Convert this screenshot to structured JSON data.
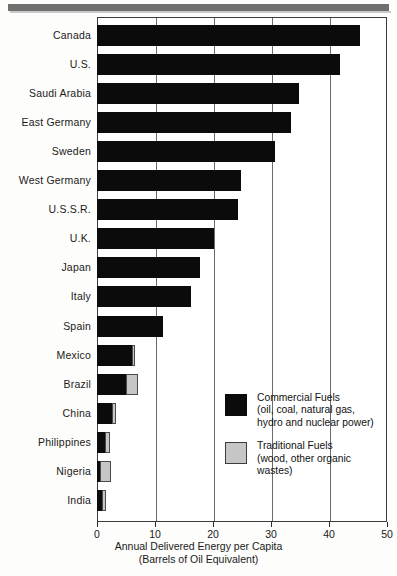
{
  "chart_data": {
    "type": "bar",
    "orientation": "horizontal",
    "stacked": true,
    "title": "",
    "xlabel": "Annual Delivered Energy per Capita",
    "xlabel_line2": "(Barrels of Oil Equivalent)",
    "ylabel": "",
    "xlim": [
      0,
      50
    ],
    "xticks": [
      0,
      10,
      20,
      30,
      40,
      50
    ],
    "xtick_labels": [
      "0",
      "10",
      "20",
      "30",
      "40",
      "50"
    ],
    "grid": "vertical",
    "legend_position": "inside-lower-right",
    "categories": [
      "Canada",
      "U.S.",
      "Saudi Arabia",
      "East Germany",
      "Sweden",
      "West Germany",
      "U.S.S.R.",
      "U.K.",
      "Japan",
      "Italy",
      "Spain",
      "Mexico",
      "Brazil",
      "China",
      "Philippines",
      "Nigeria",
      "India"
    ],
    "series": [
      {
        "name": "Commercial Fuels",
        "color": "#0b0b0b",
        "values": [
          45.3,
          41.9,
          34.8,
          33.4,
          30.7,
          24.8,
          24.3,
          20.2,
          17.8,
          16.2,
          11.3,
          6.0,
          5.0,
          2.6,
          1.4,
          0.6,
          0.9
        ]
      },
      {
        "name": "Traditional Fuels",
        "color": "#c6c6c6",
        "values": [
          0,
          0,
          0,
          0,
          0,
          0,
          0,
          0,
          0,
          0,
          0,
          0.5,
          2.0,
          0.6,
          0.9,
          1.8,
          0.7
        ]
      }
    ],
    "totals": [
      45.3,
      41.9,
      34.8,
      33.4,
      30.7,
      24.8,
      24.3,
      20.2,
      17.8,
      16.2,
      11.3,
      6.5,
      7.0,
      3.2,
      2.3,
      2.4,
      1.6
    ]
  },
  "legend": {
    "items": [
      {
        "swatch": "dark",
        "line1": "Commercial Fuels",
        "line2": "(oil, coal, natural gas,",
        "line3": "hydro and nuclear power)"
      },
      {
        "swatch": "light",
        "line1": "Traditional Fuels",
        "line2": "(wood, other organic",
        "line3": "wastes)"
      }
    ]
  }
}
